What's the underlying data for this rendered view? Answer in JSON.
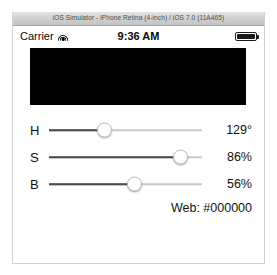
{
  "window": {
    "title": "iOS Simulator - iPhone Retina (4-inch) / iOS 7.0 (11A465)"
  },
  "status_bar": {
    "carrier": "Carrier",
    "wifi_icon": "wifi-icon",
    "time": "9:36 AM",
    "battery_icon": "battery-full-icon",
    "battery_level_percent": 100
  },
  "color_preview": {
    "hex": "#000000"
  },
  "sliders": [
    {
      "name": "hue",
      "label": "H",
      "value_text": "129°",
      "position_percent": 36
    },
    {
      "name": "saturation",
      "label": "S",
      "value_text": "86%",
      "position_percent": 86
    },
    {
      "name": "brightness",
      "label": "B",
      "value_text": "56%",
      "position_percent": 56
    }
  ],
  "web_color": {
    "text": "Web: #000000"
  }
}
